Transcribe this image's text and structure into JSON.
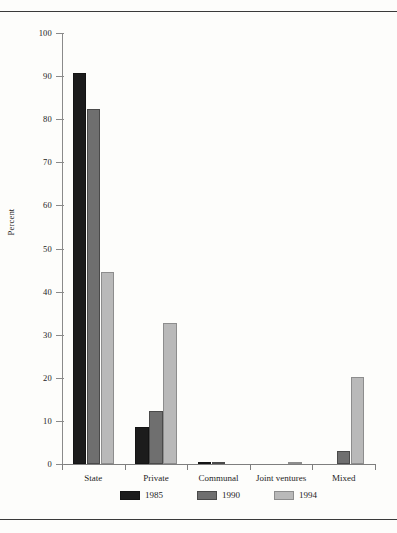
{
  "page": {
    "top_rule": "",
    "bottom_rule": ""
  },
  "chart_data": {
    "type": "bar",
    "title": "",
    "subtitle": "",
    "xlabel": "",
    "ylabel": "Percent",
    "ylim": [
      0,
      100
    ],
    "ytick_step": 10,
    "ytick_labels": [
      "0",
      "10",
      "20",
      "30",
      "40",
      "50",
      "60",
      "70",
      "80",
      "90",
      "100"
    ],
    "grid": false,
    "legend_position": "bottom-center",
    "categories": [
      "State",
      "Private",
      "Communal",
      "Joint ventures",
      "Mixed"
    ],
    "series": [
      {
        "name": "1985",
        "color": "#1c1c1c",
        "values": [
          90.8,
          8.7,
          0.4,
          0.0,
          0.0
        ]
      },
      {
        "name": "1990",
        "color": "#6f6f6f",
        "values": [
          82.3,
          12.2,
          0.3,
          0.0,
          3.0
        ]
      },
      {
        "name": "1994",
        "color": "#b9b9b9",
        "values": [
          44.6,
          32.7,
          0.0,
          0.4,
          20.3
        ]
      }
    ]
  }
}
